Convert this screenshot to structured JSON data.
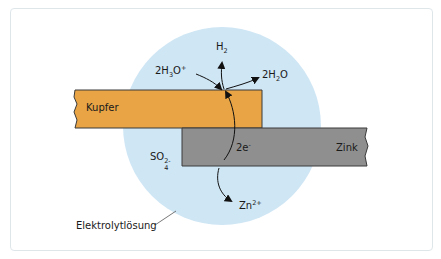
{
  "diagram": {
    "colors": {
      "electrolyte": "#cfe6f5",
      "copper": "#e8a445",
      "zinc": "#8f8f8f",
      "outline": "#333333",
      "text": "#1a1a1a"
    },
    "labels": {
      "h2": {
        "base": "H",
        "sub": "2"
      },
      "h3o": {
        "coef": "2H",
        "sub": "3",
        "mid": "O",
        "sup": "+"
      },
      "h2o": {
        "coef": "2H",
        "sub": "2",
        "mid": "O"
      },
      "copper": "Kupfer",
      "zinc": "Zink",
      "electrons": {
        "base": "2e",
        "sup": "-"
      },
      "sulfate": {
        "base": "SO",
        "sup": "2-",
        "sub": "4"
      },
      "zinc_ion": {
        "base": "Zn",
        "sup": "2+"
      },
      "electrolyte": "Elektrolytlösung"
    }
  }
}
